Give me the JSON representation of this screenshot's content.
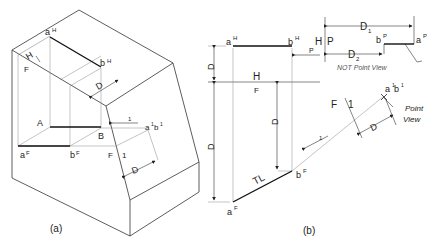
{
  "figure": {
    "panel_a": {
      "caption": "(a)",
      "labels": {
        "aH": "a",
        "aH_sup": "H",
        "bH": "b",
        "bH_sup": "H",
        "H": "H",
        "F": "F",
        "D": "D",
        "A": "A",
        "B": "B",
        "aF": "a",
        "aF_sup": "F",
        "bF": "b",
        "bF_sup": "F",
        "F2": "F",
        "one": "1",
        "D2": "D",
        "arrow1": "1",
        "a1b1": "a",
        "a1b1_sup": "1",
        "a1b1_b": "b",
        "a1b1_b_sup": "1"
      }
    },
    "panel_b": {
      "caption": "(b)",
      "labels": {
        "aH": "a",
        "aH_sup": "H",
        "bH": "b",
        "bH_sup": "H",
        "H_P_H": "H",
        "H_P_P": "P",
        "P_arrow": "P",
        "D1_top": "D",
        "D1_top_sub": "1",
        "D2_top": "D",
        "D2_top_sub": "2",
        "bP": "b",
        "bP_sup": "P",
        "aP": "a",
        "aP_sup": "P",
        "not_point_view": "NOT Point View",
        "H_F_H": "H",
        "H_F_F": "F",
        "D_left": "D",
        "D1_left": "D",
        "D1_left_sub": "1",
        "D2_mid": "D",
        "D2_mid_sub": "2",
        "F_1_F": "F",
        "F_1_1": "1",
        "arrow1": "1",
        "a1b1": "a",
        "a1b1_sup": "1",
        "a1b1_b": "b",
        "a1b1_b_sup": "1",
        "point_view_1": "Point",
        "point_view_2": "View",
        "D_right": "D",
        "TL": "TL",
        "aF": "a",
        "aF_sup": "F",
        "bF": "b",
        "bF_sup": "F"
      }
    }
  }
}
